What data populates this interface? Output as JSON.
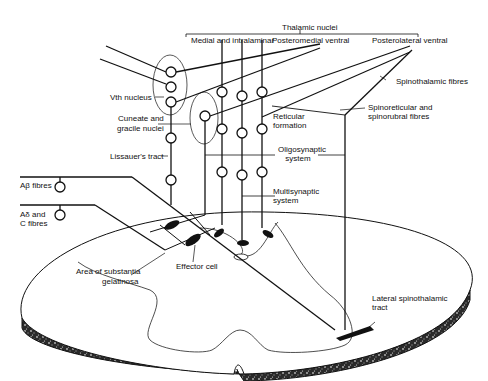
{
  "figure": {
    "labels": {
      "thalamic_nuclei": "Thalamic nuclei",
      "medial_intralaminar": "Medial and intralaminar",
      "posteromedial_ventral": "Posteromedial ventral",
      "posterolateral_ventral": "Posterolateral ventral",
      "spinothalamic_fibres": "Spinothalamic fibres",
      "spinoreticular_1": "Spinoreticular and",
      "spinoreticular_2": "spinorubral fibres",
      "vth_nucleus": "Vth nucleus",
      "cuneate_1": "Cuneate and",
      "cuneate_2": "gracile nuclei",
      "reticular_1": "Reticular",
      "reticular_2": "formation",
      "lissauer": "Lissauer's tract",
      "oligo_1": "Oligosynaptic",
      "oligo_2": "system",
      "a_beta": "Aβ fibres",
      "a_delta_1": "Aδ and",
      "a_delta_2": "C fibres",
      "multi_1": "Multisynaptic",
      "multi_2": "system",
      "effector": "Effector cell",
      "substantia_1": "Area of substantia",
      "substantia_2": "gelatinosa",
      "lateral_1": "Lateral spinothalamic",
      "lateral_2": "tract"
    }
  }
}
